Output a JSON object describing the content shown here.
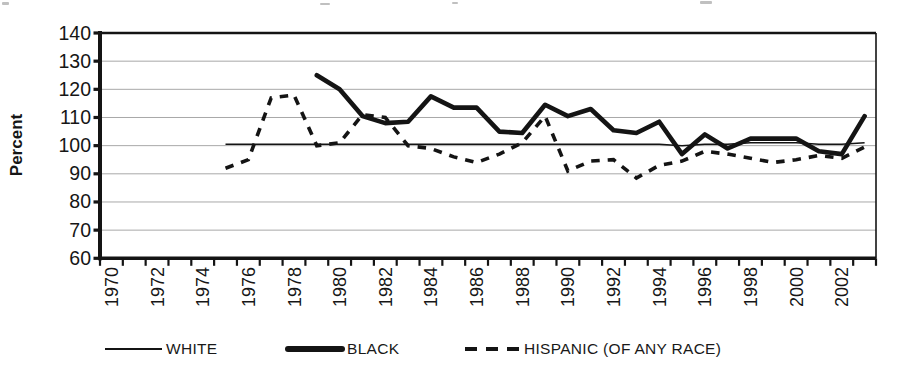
{
  "chart_data": {
    "type": "line",
    "title": "",
    "xlabel": "",
    "ylabel": "Percent",
    "ylim": [
      60,
      140
    ],
    "ytick_step": 10,
    "y_ticks": [
      140,
      130,
      120,
      110,
      100,
      90,
      80,
      70,
      60
    ],
    "x_range": [
      1970,
      2003
    ],
    "x_tick_labels": [
      "1970",
      "1972",
      "1974",
      "1976",
      "1978",
      "1980",
      "1982",
      "1984",
      "1986",
      "1988",
      "1990",
      "1992",
      "1994",
      "1996",
      "1998",
      "2000",
      "2002"
    ],
    "grid": true,
    "legend_position": "bottom",
    "line_color": "#141414",
    "grid_color": "#a8a8a8",
    "series": [
      {
        "name": "WHITE",
        "style": "thin-solid",
        "points": [
          [
            1975,
            100.5
          ],
          [
            1976,
            100.5
          ],
          [
            1977,
            100.5
          ],
          [
            1978,
            100.5
          ],
          [
            1979,
            100.5
          ],
          [
            1980,
            100.5
          ],
          [
            1981,
            100.5
          ],
          [
            1982,
            100.5
          ],
          [
            1983,
            100.5
          ],
          [
            1984,
            100.5
          ],
          [
            1985,
            100.5
          ],
          [
            1986,
            100.5
          ],
          [
            1987,
            100.5
          ],
          [
            1988,
            100.5
          ],
          [
            1989,
            100.5
          ],
          [
            1990,
            100.5
          ],
          [
            1991,
            100.5
          ],
          [
            1992,
            100.5
          ],
          [
            1993,
            100.5
          ],
          [
            1994,
            100.5
          ],
          [
            1995,
            100
          ],
          [
            1996,
            100.5
          ],
          [
            1997,
            100.5
          ],
          [
            1998,
            101
          ],
          [
            1999,
            101
          ],
          [
            2000,
            101
          ],
          [
            2001,
            100.5
          ],
          [
            2002,
            100.5
          ],
          [
            2003,
            101
          ]
        ]
      },
      {
        "name": "BLACK",
        "style": "thick-solid",
        "points": [
          [
            1979,
            125
          ],
          [
            1980,
            120
          ],
          [
            1981,
            110.5
          ],
          [
            1982,
            108
          ],
          [
            1983,
            108.5
          ],
          [
            1984,
            117.5
          ],
          [
            1985,
            113.5
          ],
          [
            1986,
            113.5
          ],
          [
            1987,
            105
          ],
          [
            1988,
            104.5
          ],
          [
            1989,
            114.5
          ],
          [
            1990,
            110.5
          ],
          [
            1991,
            113
          ],
          [
            1992,
            105.5
          ],
          [
            1993,
            104.5
          ],
          [
            1994,
            108.5
          ],
          [
            1995,
            97
          ],
          [
            1996,
            104
          ],
          [
            1997,
            99
          ],
          [
            1998,
            102.5
          ],
          [
            1999,
            102.5
          ],
          [
            2000,
            102.5
          ],
          [
            2001,
            98
          ],
          [
            2002,
            97
          ],
          [
            2003,
            110.5
          ]
        ]
      },
      {
        "name": "HISPANIC (OF ANY RACE)",
        "style": "dashed",
        "points": [
          [
            1975,
            92
          ],
          [
            1976,
            95
          ],
          [
            1977,
            117
          ],
          [
            1978,
            118
          ],
          [
            1979,
            100
          ],
          [
            1980,
            101
          ],
          [
            1981,
            111
          ],
          [
            1982,
            110
          ],
          [
            1983,
            100
          ],
          [
            1984,
            99
          ],
          [
            1985,
            96
          ],
          [
            1986,
            94
          ],
          [
            1987,
            97
          ],
          [
            1988,
            101
          ],
          [
            1989,
            110.5
          ],
          [
            1990,
            91
          ],
          [
            1991,
            94.5
          ],
          [
            1992,
            95
          ],
          [
            1993,
            88.5
          ],
          [
            1994,
            93
          ],
          [
            1995,
            94.5
          ],
          [
            1996,
            98
          ],
          [
            1997,
            97
          ],
          [
            1998,
            95.5
          ],
          [
            1999,
            94
          ],
          [
            2000,
            95
          ],
          [
            2001,
            96.5
          ],
          [
            2002,
            95.5
          ],
          [
            2003,
            99.5
          ]
        ]
      }
    ]
  }
}
